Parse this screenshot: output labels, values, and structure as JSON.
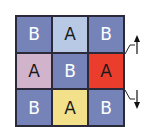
{
  "grid": {
    "rows": 3,
    "cols": 3,
    "cells": [
      {
        "label": "B",
        "color": "#7683b8",
        "text_color": "#ffffff"
      },
      {
        "label": "A",
        "color": "#b7c9e4",
        "text_color": "#1a1a1a"
      },
      {
        "label": "B",
        "color": "#7683b8",
        "text_color": "#ffffff"
      },
      {
        "label": "A",
        "color": "#d2b3cc",
        "text_color": "#1a1a1a"
      },
      {
        "label": "B",
        "color": "#7683b8",
        "text_color": "#ffffff"
      },
      {
        "label": "A",
        "color": "#ea3d2c",
        "text_color": "#1a1a1a"
      },
      {
        "label": "B",
        "color": "#7683b8",
        "text_color": "#ffffff"
      },
      {
        "label": "A",
        "color": "#f3e08a",
        "text_color": "#1a1a1a"
      },
      {
        "label": "B",
        "color": "#7683b8",
        "text_color": "#ffffff"
      }
    ]
  },
  "arrows": [
    {
      "direction": "up",
      "row_boundary": "between row 1 and row 2"
    },
    {
      "direction": "down",
      "row_boundary": "between row 2 and row 3"
    }
  ]
}
